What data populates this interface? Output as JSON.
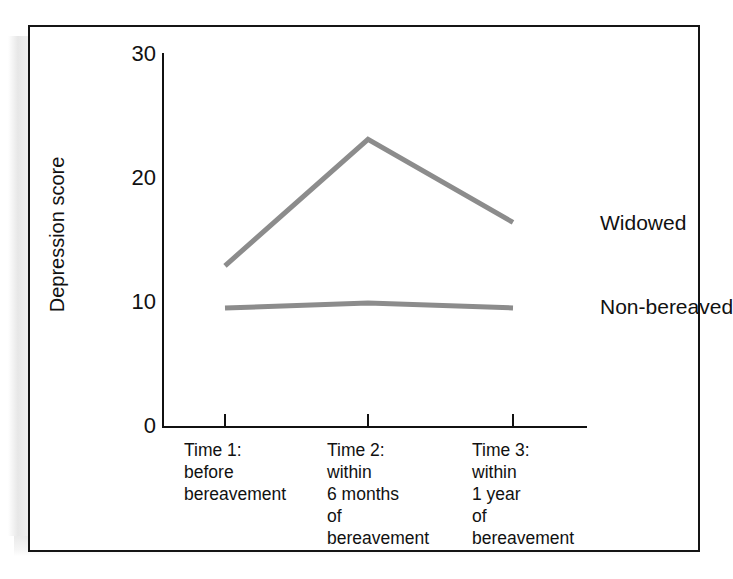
{
  "figure": {
    "type": "line-chart-figure",
    "background_color": "#ffffff",
    "frame_color": "#151515"
  },
  "chart_data": {
    "type": "line",
    "title": "",
    "xlabel": "",
    "ylabel": "Depression score",
    "categories": [
      "Time 1:\nbefore\nbereavement",
      "Time 2:\nwithin\n6 months\nof\nbereavement",
      "Time 3:\nwithin\n1 year\nof\nbereavement"
    ],
    "x_tick_labels": [
      "Time 1:\nbefore\nbereavement",
      "Time 2:\nwithin\n6 months\nof\nbereavement",
      "Time 3:\nwithin\n1 year\nof\nbereavement"
    ],
    "y_tick_labels": [
      "30",
      "20",
      "10",
      "0"
    ],
    "y_ticks": [
      30,
      20,
      10,
      0
    ],
    "ylim": [
      0,
      30
    ],
    "grid": false,
    "legend_position": "right-of-line-ends",
    "series": [
      {
        "name": "Widowed",
        "values": [
          13.0,
          23.2,
          16.5
        ],
        "color": "#8c8c8c"
      },
      {
        "name": "Non-bereaved",
        "values": [
          9.6,
          10.0,
          9.6
        ],
        "color": "#8c8c8c"
      }
    ],
    "annotations": [
      {
        "text": "Widowed",
        "near_series": "Widowed"
      },
      {
        "text": "Non-bereaved",
        "near_series": "Non-bereaved"
      }
    ]
  },
  "colors": {
    "line": "#8c8c8c",
    "axis": "#111111",
    "text": "#111111",
    "frame": "#151515"
  }
}
